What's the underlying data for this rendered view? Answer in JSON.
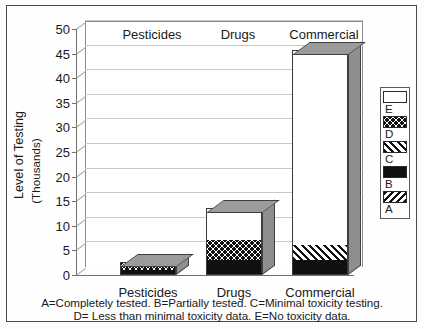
{
  "chart_data": {
    "type": "bar",
    "subtype": "stacked-3d-column",
    "title": "",
    "xlabel": "",
    "ylabel": "Level of Testing",
    "ylabel_sub": "(Thousands)",
    "ylim": [
      0,
      50
    ],
    "ytick_step": 5,
    "yticks": [
      "0",
      "5",
      "10",
      "15",
      "20",
      "25",
      "30",
      "35",
      "40",
      "45",
      "50"
    ],
    "grid": true,
    "grid_axis": "y",
    "legend_position": "right-outside",
    "categories": [
      "Pesticides",
      "Drugs",
      "Commercial"
    ],
    "series": [
      {
        "name": "A",
        "label": "A",
        "pattern": "diagonal-hatch-back",
        "values": [
          0,
          0,
          0
        ]
      },
      {
        "name": "B",
        "label": "B",
        "pattern": "solid-black",
        "values": [
          1.1,
          3.0,
          3.1
        ]
      },
      {
        "name": "C",
        "label": "C",
        "pattern": "diagonal-hatch-forward",
        "values": [
          0,
          0,
          3.0
        ]
      },
      {
        "name": "D",
        "label": "D",
        "pattern": "checkerboard",
        "values": [
          1.4,
          4.2,
          0
        ]
      },
      {
        "name": "E",
        "label": "E",
        "pattern": "white-empty",
        "values": [
          0,
          6.3,
          39.4
        ]
      }
    ],
    "totals": [
      2.5,
      13.5,
      45.5
    ],
    "annotations": [
      "A=Completely tested.  B=Partially tested.  C=Minimal toxicity testing.",
      "D= Less than minimal toxicity data.  E=No toxicity data."
    ]
  },
  "axis": {
    "y_title": "Level of Testing",
    "y_subtitle": "(Thousands)",
    "ticks": [
      "50",
      "45",
      "40",
      "35",
      "30",
      "25",
      "20",
      "15",
      "10",
      "5",
      "0"
    ]
  },
  "categories": {
    "pesticides": "Pesticides",
    "drugs": "Drugs",
    "commercial": "Commercial"
  },
  "legend": {
    "items": [
      {
        "label": "E",
        "pattern": "white-empty"
      },
      {
        "label": "D",
        "pattern": "checkerboard"
      },
      {
        "label": "C",
        "pattern": "diagonal-hatch-forward"
      },
      {
        "label": "B",
        "pattern": "solid-black"
      },
      {
        "label": "A",
        "pattern": "diagonal-hatch-back"
      }
    ]
  },
  "footnote": {
    "line1": "A=Completely tested.  B=Partially tested.  C=Minimal toxicity testing.",
    "line2": "D= Less than minimal toxicity data.  E=No toxicity data."
  },
  "colors": {
    "ink": "#111111",
    "paper": "#ffffff",
    "grid": "#c9c9c9",
    "axis": "#707070",
    "side_face": "#8e8e8e",
    "top_face": "#9b9b9b",
    "frame": "#4a4a4a"
  }
}
